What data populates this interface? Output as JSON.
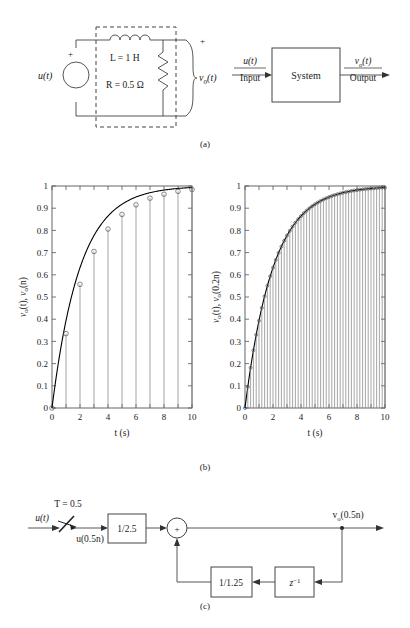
{
  "figure": {
    "panels": [
      {
        "id": "a",
        "caption": "(a)"
      },
      {
        "id": "b",
        "caption": "(b)"
      },
      {
        "id": "c",
        "caption": "(c)"
      }
    ]
  },
  "circuit": {
    "source_label": "u(t)",
    "source_polarity": "+",
    "inductor_label": "L = 1 H",
    "resistor_label": "R = 0.5 Ω",
    "output_label_v": "v",
    "output_label_sub": "o",
    "output_label_arg": "(t)",
    "output_plus": "+",
    "dashed_box": "dashed-enclosure"
  },
  "system_block": {
    "box_label": "System",
    "input_signal": "u(t)",
    "input_label": "Input",
    "output_signal_v": "v",
    "output_signal_sub": "o",
    "output_signal_arg": "(t)",
    "output_label": "Output"
  },
  "chart_left": {
    "type": "line",
    "title": "",
    "xlabel": "t (s)",
    "ylabel_parts": [
      "v",
      "o",
      "(t), ",
      "v",
      "o",
      "(n)"
    ],
    "ylabel": "vo(t), vo(n)",
    "xlim": [
      0,
      10
    ],
    "ylim": [
      0,
      1
    ],
    "xticks": [
      0,
      2,
      4,
      6,
      8,
      10
    ],
    "xticklabels": [
      "0",
      "2",
      "4",
      "6",
      "8",
      "10"
    ],
    "yticks": [
      0,
      0.1,
      0.2,
      0.3,
      0.4,
      0.5,
      0.6,
      0.7,
      0.8,
      0.9,
      1
    ],
    "yticklabels": [
      "0",
      "0.1",
      "0.2",
      "0.3",
      "0.4",
      "0.5",
      "0.6",
      "0.7",
      "0.8",
      "0.9",
      "1"
    ],
    "grid": false,
    "series": [
      {
        "name": "vo(t) continuous step response",
        "kind": "curve",
        "formula": "1 - exp(-t/2)",
        "x": [
          0,
          0.25,
          0.5,
          0.75,
          1,
          1.5,
          2,
          2.5,
          3,
          3.5,
          4,
          4.5,
          5,
          5.5,
          6,
          6.5,
          7,
          7.5,
          8,
          8.5,
          9,
          9.5,
          10
        ],
        "y": [
          0,
          0.1175,
          0.2212,
          0.3127,
          0.3935,
          0.5276,
          0.6321,
          0.7135,
          0.7769,
          0.8262,
          0.8647,
          0.8946,
          0.9179,
          0.9361,
          0.9502,
          0.9613,
          0.9698,
          0.9765,
          0.9817,
          0.9857,
          0.9889,
          0.9913,
          0.9933
        ]
      },
      {
        "name": "vo(n) sampled/stem",
        "kind": "stem",
        "x": [
          0,
          1,
          2,
          3,
          4,
          5,
          6,
          7,
          8,
          9,
          10
        ],
        "y": [
          0.0,
          0.335,
          0.557,
          0.705,
          0.806,
          0.872,
          0.915,
          0.945,
          0.963,
          0.976,
          0.984
        ]
      }
    ]
  },
  "chart_right": {
    "type": "line",
    "title": "",
    "xlabel": "t (s)",
    "ylabel_parts": [
      "v",
      "o",
      "(t), ",
      "v",
      "o",
      "(0.2n)"
    ],
    "ylabel": "vo(t), vo(0.2n)",
    "xlim": [
      0,
      10
    ],
    "ylim": [
      0,
      1
    ],
    "xticks": [
      0,
      2,
      4,
      6,
      8,
      10
    ],
    "xticklabels": [
      "0",
      "2",
      "4",
      "6",
      "8",
      "10"
    ],
    "yticks": [
      0,
      0.1,
      0.2,
      0.3,
      0.4,
      0.5,
      0.6,
      0.7,
      0.8,
      0.9,
      1
    ],
    "yticklabels": [
      "0",
      "0.1",
      "0.2",
      "0.3",
      "0.4",
      "0.5",
      "0.6",
      "0.7",
      "0.8",
      "0.9",
      "1"
    ],
    "grid": false,
    "sample_period": 0.2,
    "series": [
      {
        "name": "vo(t) continuous step response",
        "kind": "curve",
        "formula": "1 - exp(-t/2)",
        "x": [
          0,
          0.25,
          0.5,
          0.75,
          1,
          1.5,
          2,
          2.5,
          3,
          3.5,
          4,
          4.5,
          5,
          5.5,
          6,
          6.5,
          7,
          7.5,
          8,
          8.5,
          9,
          9.5,
          10
        ],
        "y": [
          0,
          0.1175,
          0.2212,
          0.3127,
          0.3935,
          0.5276,
          0.6321,
          0.7135,
          0.7769,
          0.8262,
          0.8647,
          0.8946,
          0.9179,
          0.9361,
          0.9502,
          0.9613,
          0.9698,
          0.9765,
          0.9817,
          0.9857,
          0.9889,
          0.9913,
          0.9933
        ]
      },
      {
        "name": "vo(0.2n) sampled/stem",
        "kind": "stem",
        "step": 0.2,
        "note": "stems every 0.2 s from 0 to 10 tracking 1-exp(-t/2)"
      }
    ]
  },
  "block_diagram": {
    "input_label": "u(t)",
    "sampler_label": "T = 0.5",
    "sampled_label": "u(0.5n)",
    "gain1_label": "1/2.5",
    "summer_label": "+",
    "feedback_gain_label": "1/1.25",
    "delay_label_base": "z",
    "delay_label_exp": "−1",
    "output_label_v": "v",
    "output_label_sub": "o",
    "output_label_arg": "(0.5n)"
  },
  "colors": {
    "ink": "#1a1a1a",
    "stem": "#808080",
    "marker": "#555555",
    "curve": "#000000",
    "axis": "#555555",
    "dashed": "#444444"
  }
}
